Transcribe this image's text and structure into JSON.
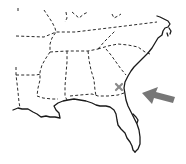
{
  "map": {
    "subject": "Southeastern United States outline map",
    "marker": {
      "type": "x-mark",
      "label": "",
      "color": "#8a8a8a",
      "position": {
        "x": 119,
        "y": 87
      }
    },
    "arrow": {
      "direction": "pointing-left",
      "color": "#777777",
      "points_to": "Georgia Atlantic coast"
    },
    "colors": {
      "background": "#ffffff",
      "coastline": "#1a1a1a",
      "state_borders": "#2a2a2a"
    }
  }
}
